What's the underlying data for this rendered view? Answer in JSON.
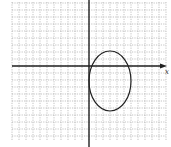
{
  "figure": {
    "type": "coordinate-plane-ellipse",
    "x_axis_label": "x",
    "grid": {
      "left": 12,
      "top": 2,
      "right": 166,
      "bottom": 141,
      "spacing": 7,
      "color": "#9a9a9a"
    },
    "axes": {
      "origin_px": [
        89,
        66
      ],
      "color": "#222222"
    },
    "ellipse": {
      "center_px": [
        110,
        81
      ],
      "rx_px": 21,
      "ry_px": 30,
      "center_units": [
        3,
        -2
      ],
      "semi_axis_x_units": 3,
      "semi_axis_y_units": 4,
      "stroke": "#222222"
    }
  }
}
